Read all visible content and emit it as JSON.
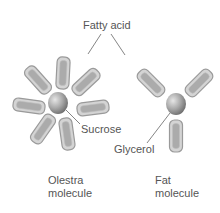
{
  "labels": {
    "fatty_acid": "Fatty acid",
    "sucrose": "Sucrose",
    "glycerol": "Glycerol",
    "olestra_line1": "Olestra",
    "olestra_line2": "molecule",
    "fat_line1": "Fat",
    "fat_line2": "molecule"
  },
  "colors": {
    "rod_fill": "#c9c9c9",
    "rod_inner": "#a9a9a9",
    "rod_outline": "#8f8f8f",
    "sphere_light": "#d8d8d8",
    "sphere_dark": "#7a7a7a",
    "leader_line": "#666666",
    "text": "#555555"
  },
  "olestra": {
    "fatty_acid_count": 8,
    "core": "Sucrose"
  },
  "fat": {
    "fatty_acid_count": 3,
    "core": "Glycerol"
  }
}
